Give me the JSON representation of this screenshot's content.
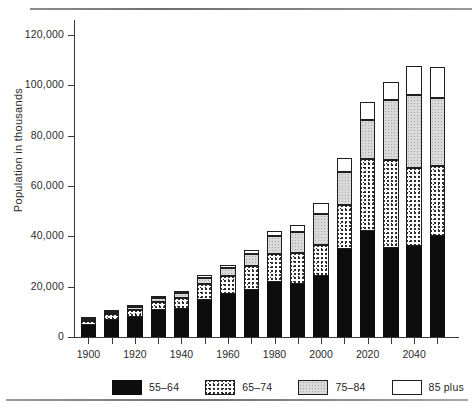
{
  "chart_data": {
    "type": "bar",
    "stacked": true,
    "title": "",
    "xlabel": "",
    "ylabel": "Population in thousands",
    "ylim": [
      0,
      130000
    ],
    "yticks": [
      0,
      20000,
      40000,
      60000,
      80000,
      100000,
      120000
    ],
    "ytick_labels": [
      "0",
      "20,000",
      "40,000",
      "60,000",
      "80,000",
      "100,000",
      "120,000"
    ],
    "xticks": [
      1900,
      1910,
      1920,
      1930,
      1940,
      1950,
      1960,
      1970,
      1980,
      1990,
      2000,
      2010,
      2020,
      2030,
      2040,
      2050
    ],
    "xtick_labels": [
      "1900",
      "",
      "1920",
      "",
      "1940",
      "",
      "1960",
      "",
      "1980",
      "",
      "2000",
      "",
      "2020",
      "",
      "2040",
      ""
    ],
    "grid": false,
    "legend_position": "bottom",
    "categories": [
      "1900",
      "1910",
      "1920",
      "1930",
      "1940",
      "1950",
      "1960",
      "1970",
      "1980",
      "1990",
      "2000",
      "2010",
      "2020",
      "2030",
      "2040",
      "2050"
    ],
    "series": [
      {
        "name": "55-64",
        "key": "s55",
        "fill": "solid-black",
        "color": "#0d0d0d",
        "values": [
          4900,
          6800,
          8100,
          10600,
          11000,
          14700,
          17000,
          18600,
          21700,
          21100,
          24300,
          35000,
          42000,
          35400,
          36200,
          40300
        ]
      },
      {
        "name": "65-74",
        "key": "s65",
        "fill": "coarse-stipple",
        "color": "#ffffff",
        "values": [
          1600,
          2200,
          2800,
          3500,
          4700,
          6300,
          7200,
          9700,
          11400,
          12100,
          12300,
          17400,
          28700,
          34800,
          30900,
          27500
        ]
      },
      {
        "name": "75-84",
        "key": "s75",
        "fill": "fine-gray-stipple",
        "color": "#d9d9d9",
        "values": [
          700,
          900,
          1100,
          1400,
          1900,
          2600,
          3400,
          4800,
          6900,
          8400,
          12400,
          13000,
          15500,
          23900,
          29200,
          27000
        ]
      },
      {
        "name": "85 plus",
        "key": "s85",
        "fill": "white",
        "color": "#ffffff",
        "values": [
          200,
          300,
          300,
          500,
          600,
          900,
          1000,
          1500,
          2200,
          3100,
          4200,
          5900,
          7000,
          7300,
          11400,
          12500
        ]
      }
    ],
    "totals": [
      7400,
      10200,
      12300,
      16000,
      18200,
      24500,
      28600,
      34600,
      42200,
      44700,
      53200,
      71300,
      93200,
      101400,
      107700,
      107300
    ]
  },
  "legend": {
    "items": [
      {
        "label": "55–64",
        "key": "s55"
      },
      {
        "label": "65–74",
        "key": "s65"
      },
      {
        "label": "75–84",
        "key": "s75"
      },
      {
        "label": "85 plus",
        "key": "s85"
      }
    ]
  }
}
